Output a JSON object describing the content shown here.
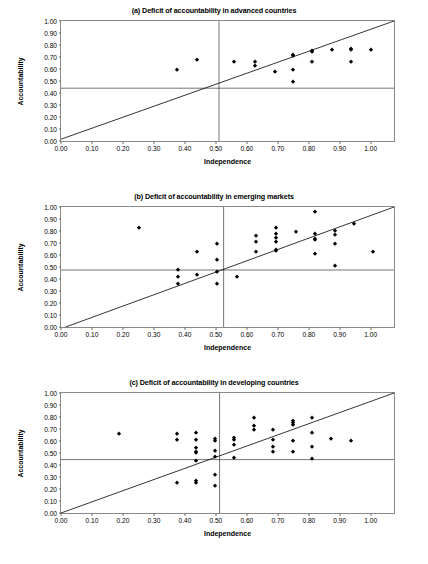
{
  "figure": {
    "axis_x_label": "Independence",
    "axis_y_label": "Accountability",
    "marker_color": "#000000",
    "axis_color": "#8a8a8a",
    "line_color": "#000000"
  },
  "ticks": {
    "x": [
      "0.00",
      "0.10",
      "0.20",
      "0.30",
      "0.40",
      "0.50",
      "0.60",
      "0.70",
      "0.80",
      "0.90",
      "1.00"
    ],
    "y": [
      "0.00",
      "0.10",
      "0.20",
      "0.30",
      "0.40",
      "0.50",
      "0.60",
      "0.70",
      "0.80",
      "0.90",
      "1.00"
    ],
    "x_values": [
      0.0,
      0.1,
      0.2,
      0.3,
      0.4,
      0.5,
      0.6,
      0.7,
      0.8,
      0.9,
      1.0
    ],
    "y_values": [
      0.0,
      0.1,
      0.2,
      0.3,
      0.4,
      0.5,
      0.6,
      0.7,
      0.8,
      0.9,
      1.0
    ]
  },
  "chart_data": [
    {
      "id": "a",
      "type": "scatter",
      "title": "(a) Deficit of accountability in advanced countries",
      "xlabel": "Independence",
      "ylabel": "Accountability",
      "xlim": [
        0.0,
        1.075
      ],
      "ylim": [
        0.0,
        1.0
      ],
      "grid": false,
      "legend": "none",
      "annotations": {
        "identity_line": {
          "from": [
            0.0,
            0.015
          ],
          "to": [
            1.075,
            1.0
          ],
          "label": "45-degree line"
        },
        "mean_accountability_line": {
          "y": 0.44,
          "orientation": "horizontal"
        },
        "mean_independence_line": {
          "x": 0.51,
          "orientation": "vertical"
        }
      },
      "points": [
        [
          0.375,
          0.595
        ],
        [
          0.44,
          0.675
        ],
        [
          0.56,
          0.655
        ],
        [
          0.625,
          0.655
        ],
        [
          0.625,
          0.625
        ],
        [
          0.69,
          0.575
        ],
        [
          0.75,
          0.705
        ],
        [
          0.75,
          0.715
        ],
        [
          0.75,
          0.59
        ],
        [
          0.75,
          0.49
        ],
        [
          0.81,
          0.75
        ],
        [
          0.81,
          0.74
        ],
        [
          0.81,
          0.655
        ],
        [
          0.875,
          0.76
        ],
        [
          0.935,
          0.765
        ],
        [
          0.935,
          0.755
        ],
        [
          0.935,
          0.655
        ],
        [
          1.0,
          0.755
        ]
      ]
    },
    {
      "id": "b",
      "type": "scatter",
      "title": "(b) Deficit of accountability in emerging markets",
      "xlabel": "Independence",
      "ylabel": "Accountability",
      "xlim": [
        0.0,
        1.075
      ],
      "ylim": [
        0.0,
        1.0
      ],
      "grid": false,
      "legend": "none",
      "annotations": {
        "identity_line": {
          "from": [
            0.015,
            0.0
          ],
          "to": [
            1.075,
            1.0
          ],
          "label": "45-degree line"
        },
        "mean_accountability_line": {
          "y": 0.475,
          "orientation": "horizontal"
        },
        "mean_independence_line": {
          "x": 0.525,
          "orientation": "vertical"
        }
      },
      "points": [
        [
          0.253,
          0.825
        ],
        [
          0.378,
          0.478
        ],
        [
          0.378,
          0.413
        ],
        [
          0.378,
          0.362
        ],
        [
          0.44,
          0.628
        ],
        [
          0.44,
          0.43
        ],
        [
          0.503,
          0.695
        ],
        [
          0.503,
          0.56
        ],
        [
          0.503,
          0.458
        ],
        [
          0.503,
          0.362
        ],
        [
          0.567,
          0.413
        ],
        [
          0.63,
          0.758
        ],
        [
          0.63,
          0.708
        ],
        [
          0.63,
          0.625
        ],
        [
          0.695,
          0.822
        ],
        [
          0.695,
          0.775
        ],
        [
          0.695,
          0.742
        ],
        [
          0.695,
          0.708
        ],
        [
          0.695,
          0.645
        ],
        [
          0.695,
          0.632
        ],
        [
          0.758,
          0.793
        ],
        [
          0.82,
          0.955
        ],
        [
          0.82,
          0.775
        ],
        [
          0.82,
          0.733
        ],
        [
          0.82,
          0.722
        ],
        [
          0.82,
          0.607
        ],
        [
          0.883,
          0.797
        ],
        [
          0.883,
          0.765
        ],
        [
          0.883,
          0.693
        ],
        [
          0.883,
          0.508
        ],
        [
          0.945,
          0.855
        ],
        [
          1.008,
          0.625
        ]
      ]
    },
    {
      "id": "c",
      "type": "scatter",
      "title": "(c) Deficit of accountability in developing countries",
      "xlabel": "Independence",
      "ylabel": "Accountability",
      "xlim": [
        0.0,
        1.075
      ],
      "ylim": [
        0.0,
        1.0
      ],
      "grid": false,
      "legend": "none",
      "annotations": {
        "identity_line": {
          "from": [
            0.0,
            0.0
          ],
          "to": [
            1.075,
            1.0
          ],
          "label": "45-degree line"
        },
        "mean_accountability_line": {
          "y": 0.445,
          "orientation": "horizontal"
        },
        "mean_independence_line": {
          "x": 0.512,
          "orientation": "vertical"
        }
      },
      "points": [
        [
          0.188,
          0.658
        ],
        [
          0.375,
          0.655
        ],
        [
          0.375,
          0.608
        ],
        [
          0.375,
          0.253
        ],
        [
          0.435,
          0.67
        ],
        [
          0.435,
          0.605
        ],
        [
          0.435,
          0.54
        ],
        [
          0.435,
          0.512
        ],
        [
          0.435,
          0.5
        ],
        [
          0.435,
          0.432
        ],
        [
          0.435,
          0.265
        ],
        [
          0.435,
          0.253
        ],
        [
          0.498,
          0.615
        ],
        [
          0.498,
          0.598
        ],
        [
          0.498,
          0.52
        ],
        [
          0.498,
          0.468
        ],
        [
          0.498,
          0.32
        ],
        [
          0.498,
          0.222
        ],
        [
          0.56,
          0.628
        ],
        [
          0.56,
          0.608
        ],
        [
          0.56,
          0.57
        ],
        [
          0.56,
          0.455
        ],
        [
          0.622,
          0.79
        ],
        [
          0.622,
          0.723
        ],
        [
          0.622,
          0.688
        ],
        [
          0.685,
          0.688
        ],
        [
          0.685,
          0.61
        ],
        [
          0.685,
          0.553
        ],
        [
          0.685,
          0.505
        ],
        [
          0.748,
          0.765
        ],
        [
          0.748,
          0.748
        ],
        [
          0.748,
          0.735
        ],
        [
          0.748,
          0.6
        ],
        [
          0.748,
          0.505
        ],
        [
          0.81,
          0.79
        ],
        [
          0.81,
          0.668
        ],
        [
          0.81,
          0.553
        ],
        [
          0.81,
          0.448
        ],
        [
          0.872,
          0.62
        ],
        [
          0.935,
          0.603
        ]
      ]
    }
  ]
}
